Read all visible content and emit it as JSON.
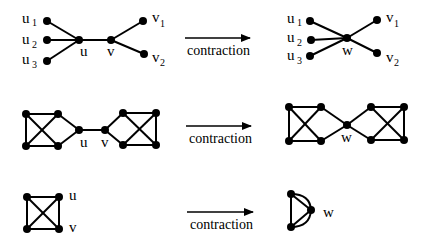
{
  "rows": [
    {
      "id": "star",
      "before": {
        "labels": {
          "u1": "u",
          "u1_sub": "1",
          "u2": "u",
          "u2_sub": "2",
          "u3": "u",
          "u3_sub": "3",
          "u": "u",
          "v": "v",
          "v1": "v",
          "v1_sub": "1",
          "v2": "v",
          "v2_sub": "2"
        }
      },
      "arrow_label": "contraction",
      "after": {
        "labels": {
          "u1": "u",
          "u1_sub": "1",
          "u2": "u",
          "u2_sub": "2",
          "u3": "u",
          "u3_sub": "3",
          "w": "w",
          "v1": "v",
          "v1_sub": "1",
          "v2": "v",
          "v2_sub": "2"
        }
      }
    },
    {
      "id": "two-k4-bridge",
      "before": {
        "labels": {
          "u": "u",
          "v": "v"
        }
      },
      "arrow_label": "contraction",
      "after": {
        "labels": {
          "w": "w"
        }
      }
    },
    {
      "id": "k4",
      "before": {
        "labels": {
          "u": "u",
          "v": "v"
        }
      },
      "arrow_label": "contraction",
      "after": {
        "labels": {
          "w": "w"
        }
      }
    }
  ],
  "colors": {
    "ink": "#000000",
    "background": "#ffffff"
  }
}
